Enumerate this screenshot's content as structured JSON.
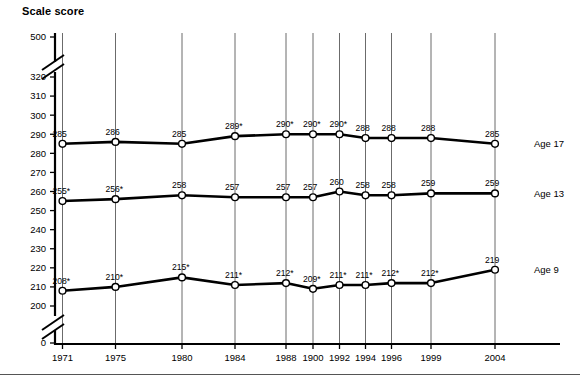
{
  "chart_data": {
    "type": "line",
    "title": "Scale score",
    "xlabel": "",
    "ylabel": "Scale score",
    "categories": [
      "1971",
      "1975",
      "1980",
      "1984",
      "1988",
      "1900",
      "1992",
      "1994",
      "1996",
      "1999",
      "2004"
    ],
    "ytick_labels": [
      "500",
      "320",
      "310",
      "300",
      "290",
      "280",
      "270",
      "260",
      "250",
      "240",
      "230",
      "220",
      "210",
      "200",
      "0"
    ],
    "ytick_values": [
      500,
      320,
      310,
      300,
      290,
      280,
      270,
      260,
      250,
      240,
      230,
      220,
      210,
      200,
      0
    ],
    "ylim": [
      195,
      325
    ],
    "axis_breaks": [
      "between 320 and 500",
      "between 0 and 200"
    ],
    "grid": "vertical gridlines at each year",
    "legend_position": "right of each series",
    "series": [
      {
        "name": "Age 17",
        "label": "Age 17",
        "values": [
          285,
          286,
          285,
          289,
          290,
          290,
          290,
          288,
          288,
          288,
          285
        ],
        "point_labels": [
          "285",
          "286",
          "285",
          "289*",
          "290*",
          "290*",
          "290*",
          "288",
          "288",
          "288",
          "285"
        ]
      },
      {
        "name": "Age 13",
        "label": "Age 13",
        "values": [
          255,
          256,
          258,
          257,
          257,
          257,
          260,
          258,
          258,
          259,
          259
        ],
        "point_labels": [
          "255*",
          "256*",
          "258",
          "257",
          "257",
          "257",
          "260",
          "258",
          "258",
          "259",
          "259"
        ]
      },
      {
        "name": "Age 9",
        "label": "Age 9",
        "values": [
          208,
          210,
          215,
          211,
          212,
          209,
          211,
          211,
          212,
          212,
          219
        ],
        "point_labels": [
          "208*",
          "210*",
          "215*",
          "211*",
          "212*",
          "209*",
          "211*",
          "211*",
          "212*",
          "212*",
          "219"
        ]
      }
    ],
    "footnote_symbol": "*",
    "colors": {
      "line": "#000000",
      "marker_fill": "#ffffff",
      "gridline": "#6b6b6b",
      "axis": "#000000",
      "background": "#ffffff"
    }
  }
}
